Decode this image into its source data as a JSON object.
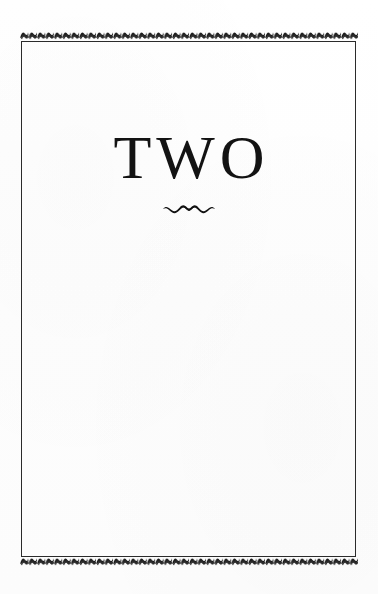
{
  "document": {
    "type": "book-chapter-title-page",
    "page_background": "#fefefe",
    "ink_color": "#131313"
  },
  "frame": {
    "name": "rule-frame",
    "border_color": "#2b2b2b",
    "border_width_px": 1
  },
  "ornaments": {
    "top_band": {
      "name": "zigzag-band-top",
      "motif": "repeating-wave-dash",
      "color": "#1a1a1a"
    },
    "bottom_band": {
      "name": "zigzag-band-bottom",
      "motif": "repeating-wave-dash",
      "color": "#1a1a1a"
    },
    "title_flourish": {
      "name": "wave-flourish-ornament",
      "motif": "double-wave-swash",
      "color": "#121212"
    }
  },
  "title": {
    "text": "TWO",
    "alignment": "center"
  }
}
